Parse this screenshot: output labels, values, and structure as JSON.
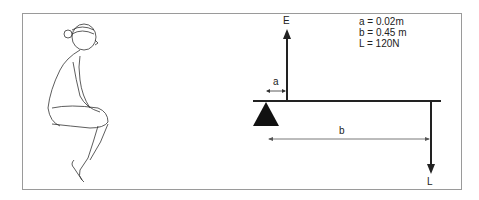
{
  "diagram": {
    "type": "lever",
    "labels": {
      "effort": "E",
      "load": "L",
      "dist_a": "a",
      "dist_b": "b"
    },
    "values": [
      "a = 0.02m",
      "b = 0.45 m",
      "L = 120N"
    ],
    "illustration": "seated-figure-hugging-knees"
  }
}
